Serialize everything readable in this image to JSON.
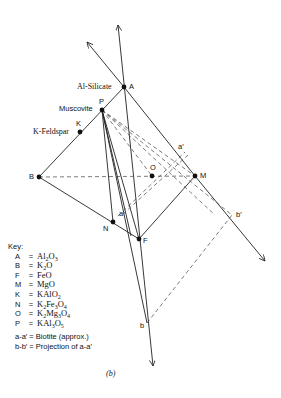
{
  "figure": {
    "caption": "(b)",
    "points": {
      "A": {
        "label": "A",
        "name": "Al-Silicate"
      },
      "P": {
        "label": "P",
        "name": "Muscovite"
      },
      "K": {
        "label": "K",
        "name": "K-Feldspar"
      },
      "B": {
        "label": "B"
      },
      "O": {
        "label": "O"
      },
      "M": {
        "label": "M"
      },
      "N": {
        "label": "N"
      },
      "F": {
        "label": "F"
      },
      "a": {
        "label": "a"
      },
      "a_prime": {
        "label": "a′"
      },
      "b": {
        "label": "b"
      },
      "b_prime": {
        "label": "b′"
      }
    }
  },
  "key": {
    "title": "Key:",
    "entries": [
      {
        "symbol": "A",
        "eq": "=",
        "formula_html": "Al<sub>2</sub>O<sub>3</sub>"
      },
      {
        "symbol": "B",
        "eq": "=",
        "formula_html": "K<sub>2</sub>O"
      },
      {
        "symbol": "F",
        "eq": "=",
        "formula_html": "FeO"
      },
      {
        "symbol": "M",
        "eq": "=",
        "formula_html": "MgO"
      },
      {
        "symbol": "K",
        "eq": "=",
        "formula_html": "KAlO<sub>2</sub>"
      },
      {
        "symbol": "N",
        "eq": "=",
        "formula_html": "K<sub>2</sub>Fe<sub>3</sub>O<sub>4</sub>"
      },
      {
        "symbol": "O",
        "eq": "=",
        "formula_html": "K<sub>2</sub>Mg<sub>3</sub>O<sub>4</sub>"
      },
      {
        "symbol": "P",
        "eq": "=",
        "formula_html": "KAl<sub>3</sub>O<sub>5</sub>"
      }
    ],
    "notes": [
      "a-a′ = Biotite (approx.)",
      "b-b′ = Projection of a-a′"
    ]
  }
}
